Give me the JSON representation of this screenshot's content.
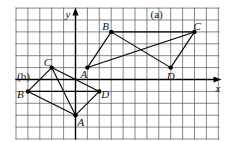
{
  "diagram": {
    "axes": {
      "x_label": "x",
      "y_label": "y"
    },
    "grid": {
      "x_min": -5,
      "x_max": 12,
      "y_min": -5,
      "y_max": 6
    },
    "shapes": [
      {
        "tag": "(a)",
        "points": [
          {
            "label": "A",
            "x": 1,
            "y": 1
          },
          {
            "label": "B",
            "x": 3,
            "y": 4
          },
          {
            "label": "C",
            "x": 10,
            "y": 4
          },
          {
            "label": "D",
            "x": 8,
            "y": 1
          }
        ],
        "segments": [
          [
            "A",
            "B"
          ],
          [
            "B",
            "C"
          ],
          [
            "C",
            "D"
          ],
          [
            "A",
            "C"
          ],
          [
            "B",
            "D"
          ]
        ]
      },
      {
        "tag": "(b)",
        "points": [
          {
            "label": "A",
            "x": 0,
            "y": -3
          },
          {
            "label": "B",
            "x": -4,
            "y": -1
          },
          {
            "label": "C",
            "x": -2,
            "y": 1
          },
          {
            "label": "D",
            "x": 2,
            "y": -1
          }
        ],
        "segments": [
          [
            "B",
            "C"
          ],
          [
            "C",
            "D"
          ],
          [
            "D",
            "A"
          ],
          [
            "A",
            "B"
          ],
          [
            "C",
            "A"
          ],
          [
            "B",
            "D"
          ]
        ]
      }
    ]
  }
}
